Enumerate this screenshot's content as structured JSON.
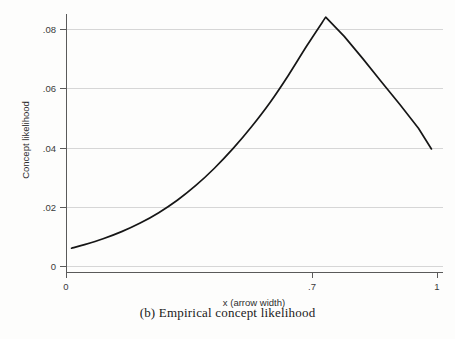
{
  "caption": "(b) Empirical concept likelihood",
  "chart_data": {
    "type": "line",
    "title": "",
    "xlabel": "x (arrow width)",
    "ylabel": "Concept likelihood",
    "xlim": [
      0,
      1
    ],
    "ylim": [
      0,
      0.09
    ],
    "xticks": [
      0,
      0.7,
      1
    ],
    "xticklabels": [
      "0",
      ".7",
      "1"
    ],
    "yticks": [
      0,
      0.02,
      0.04,
      0.06,
      0.08
    ],
    "yticklabels": [
      "0",
      ".02",
      ".04",
      ".06",
      ".08"
    ],
    "grid": "horizontal",
    "legend": "none",
    "line_color": "#161616",
    "grid_color": "#d6d6d6",
    "series": [
      {
        "name": "Concept likelihood",
        "x": [
          0.015,
          0.05,
          0.1,
          0.15,
          0.2,
          0.25,
          0.3,
          0.35,
          0.4,
          0.45,
          0.5,
          0.55,
          0.6,
          0.65,
          0.7,
          0.75,
          0.8,
          0.85,
          0.9,
          0.95,
          0.985
        ],
        "values": [
          0.006,
          0.0072,
          0.0092,
          0.0116,
          0.0145,
          0.018,
          0.0222,
          0.0272,
          0.033,
          0.0396,
          0.047,
          0.0552,
          0.0645,
          0.0745,
          0.084,
          0.0775,
          0.07,
          0.0622,
          0.0545,
          0.0465,
          0.0395
        ]
      }
    ]
  }
}
